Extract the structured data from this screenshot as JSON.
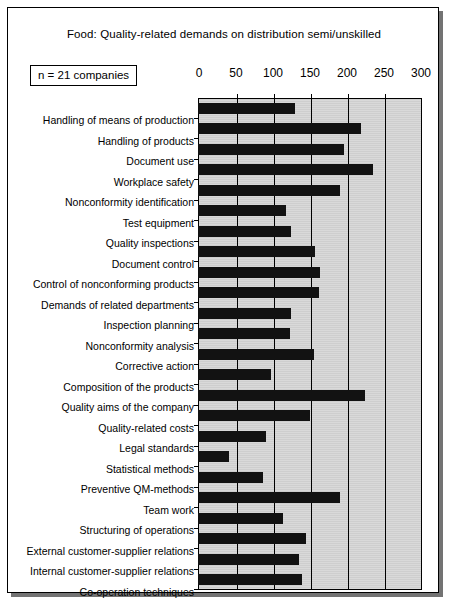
{
  "title": "Food:  Quality-related demands on distribution semi/unskilled",
  "sample_note": "n = 21 companies",
  "chart_data": {
    "type": "bar",
    "orientation": "horizontal",
    "title": "Food:  Quality-related demands on distribution semi/unskilled",
    "xlabel": "",
    "ylabel": "",
    "xlim": [
      0,
      300
    ],
    "xticks": [
      0,
      50,
      100,
      150,
      200,
      250,
      300
    ],
    "xtick_labels": [
      "0",
      "50",
      "100",
      "150",
      "200",
      "250",
      "300"
    ],
    "grid": true,
    "legend": false,
    "annotations": [
      "n = 21 companies"
    ],
    "bar_color": "#121212",
    "plot_bg_color": "#d2d2d2",
    "categories": [
      "Handling of means of production",
      "Handling of products",
      "Document use",
      "Workplace safety",
      "Nonconformity identification",
      "Test equipment",
      "Quality inspections",
      "Document control",
      "Control of nonconforming products",
      "Demands of related departments",
      "Inspection planning",
      "Nonconformity analysis",
      "Corrective action",
      "Composition of the  products",
      "Quality aims of the company",
      "Quality-related costs",
      "Legal standards",
      "Statistical methods",
      "Preventive QM-methods",
      "Team work",
      "Structuring of operations",
      "External customer-supplier relations",
      "Internal customer-supplier relations",
      "Co-operation techniques"
    ],
    "values": [
      130,
      219,
      196,
      235,
      190,
      117,
      124,
      157,
      164,
      162,
      124,
      123,
      155,
      97,
      224,
      150,
      90,
      40,
      86,
      190,
      113,
      145,
      135,
      139
    ]
  }
}
